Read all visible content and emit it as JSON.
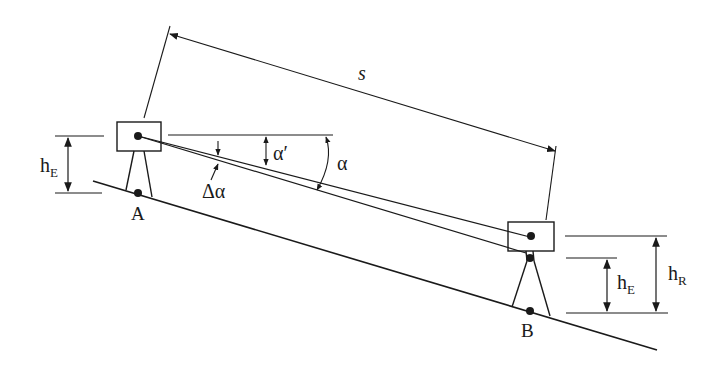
{
  "diagram": {
    "labels": {
      "distance": "s",
      "station_a": "A",
      "station_b": "B",
      "instrument_height_a": "h",
      "instrument_height_a_sub": "E",
      "instrument_height_b": "h",
      "instrument_height_b_sub": "E",
      "reflector_height": "h",
      "reflector_height_sub": "R",
      "angle_alpha": "α",
      "angle_alpha_prime": "α′",
      "angle_delta_alpha": "Δα"
    },
    "colors": {
      "ink": "#1a1a1a",
      "background": "#ffffff"
    }
  }
}
